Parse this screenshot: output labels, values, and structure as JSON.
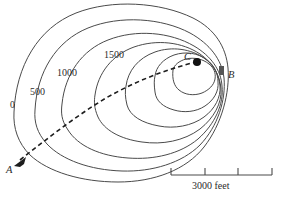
{
  "figure": {
    "type": "topographic-contour-map",
    "background_color": "#ffffff",
    "line_color": "#4a4a4a",
    "path_color": "#1d1d1d"
  },
  "contours": {
    "interval": 500,
    "unit": "feet",
    "labeled": [
      {
        "value": "0",
        "x": 12,
        "y": 106
      },
      {
        "value": "500",
        "x": 33,
        "y": 93
      },
      {
        "value": "1000",
        "x": 60,
        "y": 74
      },
      {
        "value": "1500",
        "x": 108,
        "y": 56
      }
    ],
    "unlabeled_count": 3,
    "total_count": 7
  },
  "points": [
    {
      "id": "A",
      "label": "A",
      "x": 11,
      "y": 166,
      "marker": "arrowhead"
    },
    {
      "id": "B",
      "label": "B",
      "x": 228,
      "y": 74,
      "marker": "square"
    },
    {
      "id": "C",
      "label": "C",
      "x": 187,
      "y": 60,
      "marker": "dot"
    }
  ],
  "path": {
    "name": "dashed-route",
    "from": "A",
    "to": "C",
    "style": "dashed",
    "arrow_at": "A"
  },
  "scale_bar": {
    "label": "3000 feet",
    "segments": 3,
    "x_start": 171,
    "x_end": 272,
    "y": 175
  }
}
